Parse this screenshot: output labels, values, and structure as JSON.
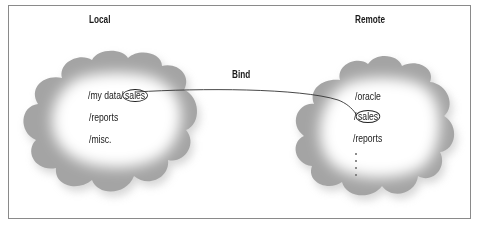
{
  "diagram": {
    "type": "network-filesystem-bind",
    "left_panel": {
      "title": "Local",
      "paths": [
        {
          "prefix": "/my data/",
          "highlight": "sales"
        },
        {
          "prefix": "/reports",
          "highlight": ""
        },
        {
          "prefix": "/misc.",
          "highlight": ""
        }
      ]
    },
    "right_panel": {
      "title": "Remote",
      "paths": [
        {
          "prefix": "/oracle",
          "highlight": ""
        },
        {
          "prefix": "/",
          "highlight": "sales"
        },
        {
          "prefix": "/reports",
          "highlight": ""
        }
      ],
      "continuation": "⋮"
    },
    "connector": {
      "label": "Bind",
      "from": "left.sales",
      "to": "right.sales"
    },
    "colors": {
      "frame": "#8a8a8a",
      "text": "#1a1a1a",
      "cloud_edge": "#9a9a9a",
      "cloud_fill": "#ffffff",
      "line": "#333333"
    }
  }
}
